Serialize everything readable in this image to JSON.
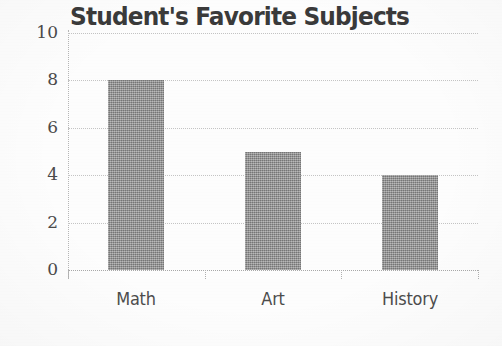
{
  "chart_data": {
    "type": "bar",
    "title": "Student's Favorite Subjects",
    "categories": [
      "Math",
      "Art",
      "History"
    ],
    "values": [
      8,
      5,
      4
    ],
    "xlabel": "",
    "ylabel": "",
    "ylim": [
      0,
      10
    ],
    "y_ticks": [
      10,
      8,
      6,
      4,
      2,
      0
    ],
    "grid": "horizontal-dotted",
    "legend": "none",
    "bar_color": "#8e8e8e",
    "gridline_color": "#c4c4c4",
    "title_color": "#3a3a3a",
    "tick_label_color": "#4a4a4a",
    "background_color": "#fdfdfd"
  },
  "axis": {
    "y_tick_labels": [
      "10",
      "8",
      "6",
      "4",
      "2",
      "0"
    ],
    "x_tick_labels": [
      "Math",
      "Art",
      "History"
    ]
  }
}
